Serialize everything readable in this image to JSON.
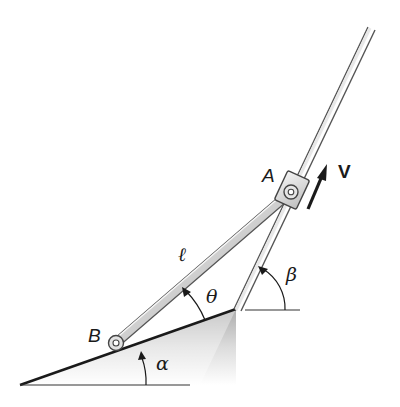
{
  "diagram": {
    "type": "mechanism",
    "labels": {
      "point_a": "A",
      "point_b": "B",
      "velocity": "V",
      "length": "ℓ",
      "theta": "θ",
      "beta": "β",
      "alpha": "α"
    },
    "colors": {
      "line": "#1a1a1a",
      "rod_fill": "#d9d9d9",
      "slope_shade": "#bdbdbd"
    }
  }
}
